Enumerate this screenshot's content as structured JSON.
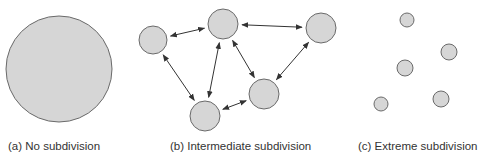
{
  "colors": {
    "fill": "#d6d6d6",
    "stroke": "#6a6a6a",
    "arrow": "#333333",
    "text": "#333333"
  },
  "panels": [
    {
      "id": "a",
      "caption": "(a) No subdivision",
      "circles": [
        {
          "cx": 59,
          "cy": 69,
          "r": 53
        }
      ],
      "edges": []
    },
    {
      "id": "b",
      "caption": "(b) Intermediate subdivision",
      "circles": [
        {
          "cx": 153,
          "cy": 40,
          "r": 14
        },
        {
          "cx": 223,
          "cy": 24,
          "r": 15
        },
        {
          "cx": 321,
          "cy": 28,
          "r": 15
        },
        {
          "cx": 264,
          "cy": 94,
          "r": 15
        },
        {
          "cx": 205,
          "cy": 116,
          "r": 15
        }
      ],
      "edges": [
        {
          "from": 0,
          "to": 1,
          "type": "bidirectional"
        },
        {
          "from": 1,
          "to": 2,
          "type": "bidirectional"
        },
        {
          "from": 0,
          "to": 4,
          "type": "bidirectional"
        },
        {
          "from": 1,
          "to": 4,
          "type": "bidirectional"
        },
        {
          "from": 1,
          "to": 3,
          "type": "bidirectional"
        },
        {
          "from": 2,
          "to": 3,
          "type": "bidirectional"
        },
        {
          "from": 4,
          "to": 3,
          "type": "bidirectional"
        }
      ]
    },
    {
      "id": "c",
      "caption": "(c) Extreme subdivision",
      "circles": [
        {
          "cx": 407,
          "cy": 20,
          "r": 7
        },
        {
          "cx": 449,
          "cy": 52,
          "r": 8
        },
        {
          "cx": 405,
          "cy": 68,
          "r": 8
        },
        {
          "cx": 441,
          "cy": 99,
          "r": 8
        },
        {
          "cx": 381,
          "cy": 104,
          "r": 7
        }
      ],
      "edges": []
    }
  ]
}
